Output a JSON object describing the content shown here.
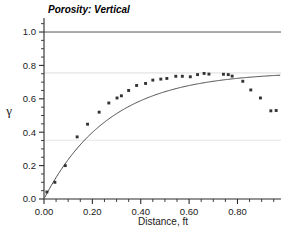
{
  "chart_data": {
    "type": "scatter",
    "title": "Porosity: Vertical",
    "xlabel": "Distance, ft",
    "ylabel": "γ",
    "xlim": [
      0.0,
      0.98
    ],
    "ylim": [
      0.0,
      1.06
    ],
    "xticks": [
      0.0,
      0.2,
      0.4,
      0.6,
      0.8
    ],
    "xtick_labels": [
      "0.00",
      "0.20",
      "0.40",
      "0.60",
      "0.80"
    ],
    "xminor_step": 0.05,
    "yticks": [
      0.0,
      0.2,
      0.4,
      0.6,
      0.8,
      1.0
    ],
    "ytick_labels": [
      "0.0",
      "0.2",
      "0.4",
      "0.6",
      "0.8",
      "1.0"
    ],
    "yminor_step": 0.05,
    "grid": "horizontal-reference-lines",
    "legend": "none",
    "reference_lines": [
      {
        "name": "sill-unit",
        "y": 1.0,
        "color": "#555555",
        "width": 1.0
      },
      {
        "name": "model-sill",
        "y": 0.755,
        "color": "#d8d8d8",
        "width": 0.9
      },
      {
        "name": "nugget-plus",
        "y": 0.352,
        "color": "#e2e2e2",
        "width": 0.9
      }
    ],
    "series": [
      {
        "name": "experimental-variogram",
        "marker": "filled-square",
        "color": "#333333",
        "points": [
          [
            0.012,
            0.042
          ],
          [
            0.045,
            0.1
          ],
          [
            0.088,
            0.2
          ],
          [
            0.137,
            0.372
          ],
          [
            0.18,
            0.448
          ],
          [
            0.228,
            0.52
          ],
          [
            0.268,
            0.575
          ],
          [
            0.302,
            0.605
          ],
          [
            0.32,
            0.618
          ],
          [
            0.35,
            0.65
          ],
          [
            0.383,
            0.68
          ],
          [
            0.42,
            0.692
          ],
          [
            0.45,
            0.712
          ],
          [
            0.483,
            0.718
          ],
          [
            0.508,
            0.722
          ],
          [
            0.545,
            0.735
          ],
          [
            0.572,
            0.735
          ],
          [
            0.605,
            0.732
          ],
          [
            0.635,
            0.745
          ],
          [
            0.662,
            0.752
          ],
          [
            0.682,
            0.748
          ],
          [
            0.742,
            0.747
          ],
          [
            0.762,
            0.745
          ],
          [
            0.778,
            0.736
          ],
          [
            0.822,
            0.705
          ],
          [
            0.855,
            0.653
          ],
          [
            0.895,
            0.605
          ],
          [
            0.938,
            0.528
          ],
          [
            0.96,
            0.53
          ]
        ]
      }
    ],
    "model_curve": {
      "name": "fitted-exponential-model",
      "color": "#4a4a4a",
      "width": 1.0,
      "form": "exponential",
      "sill": 0.762,
      "range": 0.27,
      "nugget": 0.0,
      "x_start": 0.004,
      "x_end": 0.975
    }
  },
  "axes": {
    "x_axis_name": "distance-axis",
    "y_axis_name": "gamma-axis"
  }
}
